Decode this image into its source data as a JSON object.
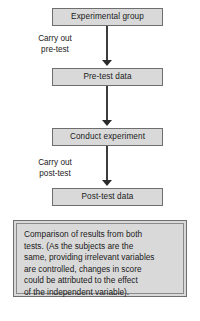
{
  "diagram": {
    "type": "flowchart",
    "colors": {
      "box_fill": "#d9d9d9",
      "box_border": "#6e6e6e",
      "arrow": "#3d3d3d",
      "text": "#1a1a1a",
      "background": "#ffffff"
    },
    "nodes": [
      {
        "id": "experimental-group",
        "label": "Experimental group"
      },
      {
        "id": "pre-test-data",
        "label": "Pre-test data"
      },
      {
        "id": "conduct-experiment",
        "label": "Conduct experiment"
      },
      {
        "id": "post-test-data",
        "label": "Post-test data"
      }
    ],
    "edge_labels": [
      {
        "id": "carry-out-pre-test",
        "line1": "Carry out",
        "line2": "pre-test"
      },
      {
        "id": "carry-out-post-test",
        "line1": "Carry out",
        "line2": "post-test"
      }
    ],
    "conclusion": {
      "id": "comparison-panel",
      "lines": [
        "Comparison of results from both",
        "tests.  (As the subjects are the",
        "same, providing irrelevant variables",
        "are controlled, changes in score",
        "could be attributed to the effect",
        "of the independent variable)."
      ]
    }
  }
}
